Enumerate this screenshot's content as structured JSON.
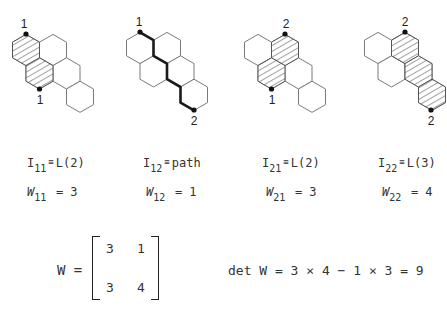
{
  "panels": [
    {
      "id": "I11",
      "top_label": "1",
      "bottom_label": "1",
      "label_symbol": "I",
      "label_subscript": "11",
      "label_equiv": "≡",
      "label_value": "L(2)",
      "weight_symbol": "W",
      "weight_subscript": "11",
      "weight_value": "= 3"
    },
    {
      "id": "I12",
      "top_label": "1",
      "bottom_label": "2",
      "label_symbol": "I",
      "label_subscript": "12",
      "label_equiv": "≡",
      "label_value": "path",
      "weight_symbol": "W",
      "weight_subscript": "12",
      "weight_value": "= 1"
    },
    {
      "id": "I21",
      "top_label": "2",
      "bottom_label": "1",
      "label_symbol": "I",
      "label_subscript": "21",
      "label_equiv": "≡",
      "label_value": "L(2)",
      "weight_symbol": "W",
      "weight_subscript": "21",
      "weight_value": "= 3"
    },
    {
      "id": "I22",
      "top_label": "2",
      "bottom_label": "2",
      "label_symbol": "I",
      "label_subscript": "22",
      "label_equiv": "≡",
      "label_value": "L(3)",
      "weight_symbol": "W",
      "weight_subscript": "22",
      "weight_value": "= 4"
    }
  ],
  "matrix": {
    "lhs": "W =",
    "cells": [
      [
        "3",
        "1"
      ],
      [
        "3",
        "4"
      ]
    ]
  },
  "determinant": {
    "text": "det W = 3 × 4 − 1 × 3 = 9"
  },
  "colors": {
    "hex_stroke": "#7a7a7a",
    "hatch": "#444444",
    "path": "#1a1a1a"
  }
}
